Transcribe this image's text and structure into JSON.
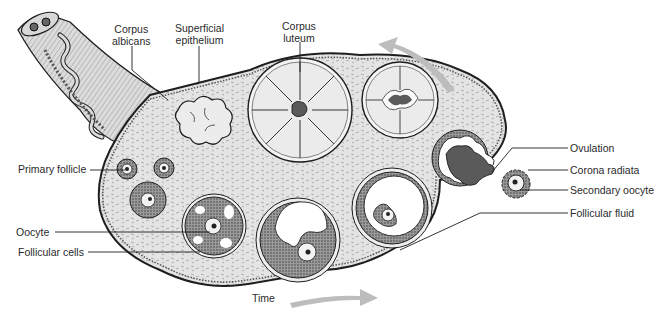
{
  "diagram": {
    "colors": {
      "tissue": "#e6e6e6",
      "follicular_cells": "#8c8c8c",
      "corpus_fill": "#ebebeb",
      "dark_fluid": "#5a5a5a",
      "outline": "#1e1e1e",
      "arrow": "#bdbdbd",
      "text": "#2a2a2a"
    },
    "labels": {
      "corpus_albicans": [
        "Corpus",
        "albicans"
      ],
      "superficial_epithelium": [
        "Superficial",
        "epithelium"
      ],
      "corpus_luteum": [
        "Corpus",
        "luteum"
      ],
      "ovulation": "Ovulation",
      "corona_radiata": "Corona radiata",
      "secondary_oocyte": "Secondary oocyte",
      "follicular_fluid": "Follicular fluid",
      "primary_follicle": "Primary follicle",
      "oocyte": "Oocyte",
      "follicular_cells": "Follicular cells",
      "time": "Time"
    },
    "arrows": [
      {
        "name": "time-arrow-bottom",
        "direction": "right"
      },
      {
        "name": "time-arrow-top",
        "direction": "left"
      }
    ]
  }
}
